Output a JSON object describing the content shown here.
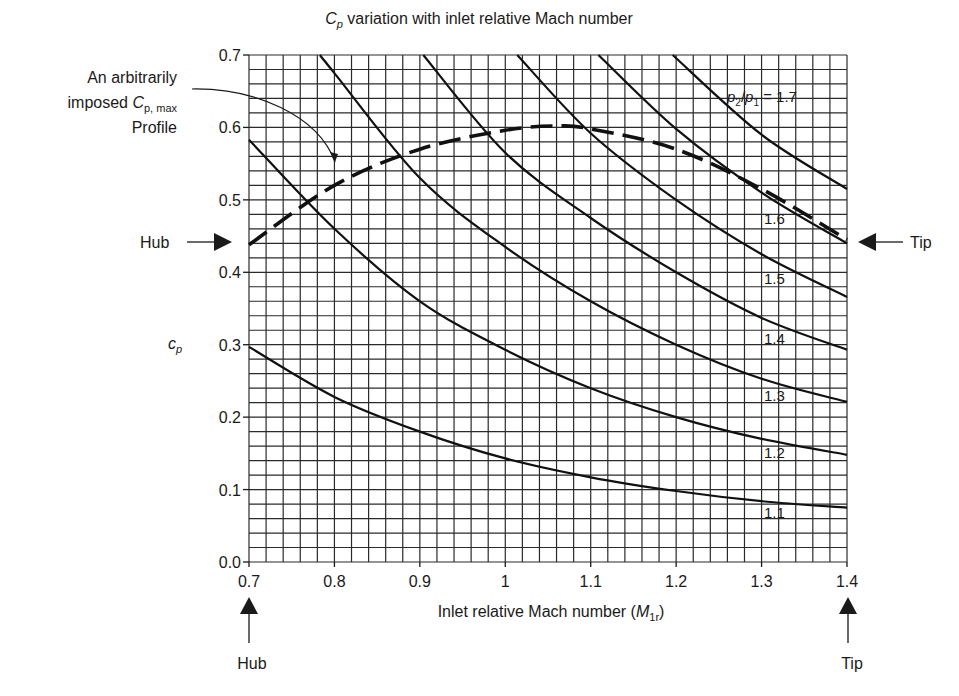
{
  "title": {
    "main_symbol": "C",
    "main_sub": "p",
    "rest": " variation with inlet relative Mach number"
  },
  "annotation": {
    "line1": "An arbitrarily",
    "line2_prefix": "imposed ",
    "line2_symbol": "C",
    "line2_sub": "p, max",
    "line3": "Profile"
  },
  "markers": {
    "hub_left": "Hub",
    "tip_right": "Tip",
    "hub_bottom": "Hub",
    "tip_bottom": "Tip"
  },
  "axes": {
    "xlabel_prefix": "Inlet relative Mach number (",
    "xlabel_symbol": "M",
    "xlabel_sub": "1r",
    "xlabel_suffix": ")",
    "ylabel_symbol": "c",
    "ylabel_sub": "p",
    "xticks": [
      "0.7",
      "0.8",
      "0.9",
      "1",
      "1.1",
      "1.2",
      "1.3",
      "1.4"
    ],
    "yticks": [
      "0.0",
      "0.1",
      "0.2",
      "0.3",
      "0.4",
      "0.5",
      "0.6",
      "0.7"
    ]
  },
  "curve_label_prefix": {
    "p2": "p",
    "sub2": "2",
    "slash": "/",
    "p1": "p",
    "sub1": "1",
    "eq": " = 1.7"
  },
  "chart_data": {
    "type": "line",
    "title": "Cp variation with inlet relative Mach number",
    "xlabel": "Inlet relative Mach number (M1r)",
    "ylabel": "cp",
    "xlim": [
      0.7,
      1.4
    ],
    "ylim": [
      0.0,
      0.7
    ],
    "grid": true,
    "grid_spacing": {
      "x": 0.02,
      "y": 0.02
    },
    "series": [
      {
        "name": "p2/p1 = 1.1",
        "label": "1.1",
        "style": "solid",
        "x": [
          0.7,
          0.8,
          0.9,
          1.0,
          1.1,
          1.2,
          1.3,
          1.4
        ],
        "y": [
          0.297,
          0.228,
          0.18,
          0.143,
          0.117,
          0.098,
          0.084,
          0.075
        ]
      },
      {
        "name": "p2/p1 = 1.2",
        "label": "1.2",
        "style": "solid",
        "x": [
          0.7,
          0.8,
          0.9,
          1.0,
          1.1,
          1.2,
          1.3,
          1.4
        ],
        "y": [
          0.583,
          0.46,
          0.36,
          0.293,
          0.24,
          0.2,
          0.17,
          0.148
        ]
      },
      {
        "name": "p2/p1 = 1.3",
        "label": "1.3",
        "style": "solid",
        "x": [
          0.783,
          0.8,
          0.9,
          1.0,
          1.1,
          1.2,
          1.3,
          1.4
        ],
        "y": [
          0.7,
          0.675,
          0.53,
          0.435,
          0.36,
          0.3,
          0.253,
          0.221
        ]
      },
      {
        "name": "p2/p1 = 1.4",
        "label": "1.4",
        "style": "solid",
        "x": [
          0.904,
          1.0,
          1.1,
          1.2,
          1.3,
          1.4
        ],
        "y": [
          0.7,
          0.565,
          0.475,
          0.4,
          0.337,
          0.293
        ]
      },
      {
        "name": "p2/p1 = 1.5",
        "label": "1.5",
        "style": "solid",
        "x": [
          1.014,
          1.1,
          1.2,
          1.3,
          1.4
        ],
        "y": [
          0.7,
          0.592,
          0.5,
          0.425,
          0.366
        ]
      },
      {
        "name": "p2/p1 = 1.6",
        "label": "1.6",
        "style": "solid",
        "x": [
          1.109,
          1.2,
          1.3,
          1.4
        ],
        "y": [
          0.7,
          0.598,
          0.51,
          0.44
        ]
      },
      {
        "name": "p2/p1 = 1.7",
        "label": "p2/p1 = 1.7",
        "style": "solid",
        "x": [
          1.196,
          1.3,
          1.4
        ],
        "y": [
          0.7,
          0.59,
          0.515
        ]
      },
      {
        "name": "Arbitrarily imposed Cp,max profile",
        "style": "dashed",
        "x": [
          0.7,
          0.8,
          0.9,
          1.0,
          1.06,
          1.1,
          1.2,
          1.3,
          1.4
        ],
        "y": [
          0.438,
          0.52,
          0.57,
          0.596,
          0.602,
          0.598,
          0.57,
          0.515,
          0.445
        ]
      }
    ],
    "annotations": [
      "An arbitrarily imposed Cp, max Profile",
      "Hub (M1r = 0.7)",
      "Tip (M1r = 1.4)"
    ]
  }
}
